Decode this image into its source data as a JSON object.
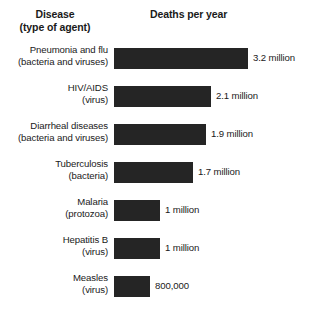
{
  "header": {
    "disease_line1": "Disease",
    "disease_line2": "(type of agent)",
    "deaths": "Deaths per year"
  },
  "chart_data": {
    "type": "bar",
    "orientation": "horizontal",
    "title": "",
    "xlabel": "Deaths per year",
    "ylabel": "Disease (type of agent)",
    "grid": false,
    "legend": false,
    "bar_color": "#252525",
    "background": "#ffffff",
    "categories": [
      "Pneumonia and flu",
      "HIV/AIDS",
      "Diarrheal diseases",
      "Tuberculosis",
      "Malaria",
      "Hepatitis B",
      "Measles"
    ],
    "agents": [
      "(bacteria and viruses)",
      "(virus)",
      "(bacteria and viruses)",
      "(bacteria)",
      "(protozoa)",
      "(virus)",
      "(virus)"
    ],
    "values": [
      3200000,
      2100000,
      1900000,
      1700000,
      1000000,
      1000000,
      800000
    ],
    "value_labels": [
      "3.2 million",
      "2.1 million",
      "1.9 million",
      "1.7 million",
      "1 million",
      "1 million",
      "800,000"
    ],
    "bar_pixel_widths": [
      134,
      97,
      92,
      79,
      46,
      46,
      36
    ],
    "row_tops": [
      48,
      86,
      124,
      162,
      200,
      238,
      276
    ]
  }
}
